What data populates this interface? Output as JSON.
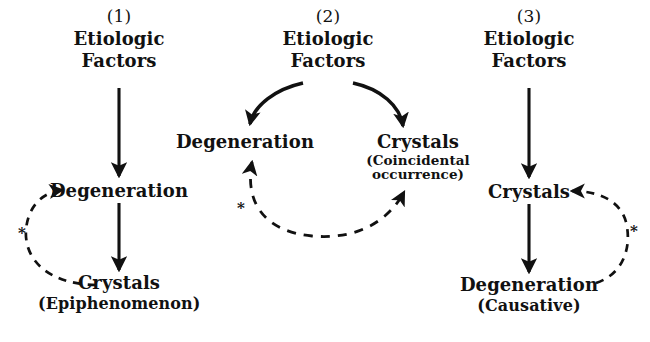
{
  "figure": {
    "background_color": "#ffffff",
    "ink_color": "#111111",
    "footnote_marker": "*"
  },
  "panels": [
    {
      "id": "panel-1",
      "number": "(1)",
      "nodes": {
        "top_line1": "Etiologic",
        "top_line2": "Factors",
        "middle": "Degeneration",
        "bottom": "Crystals",
        "bottom_qualifier": "(Epiphenomenon)"
      },
      "marker": "*"
    },
    {
      "id": "panel-2",
      "number": "(2)",
      "nodes": {
        "top_line1": "Etiologic",
        "top_line2": "Factors",
        "left": "Degeneration",
        "right": "Crystals",
        "right_qualifier_line1": "(Coincidental",
        "right_qualifier_line2": "occurrence)"
      },
      "marker": "*"
    },
    {
      "id": "panel-3",
      "number": "(3)",
      "nodes": {
        "top_line1": "Etiologic",
        "top_line2": "Factors",
        "middle": "Crystals",
        "bottom": "Degeneration",
        "bottom_qualifier": "(Causative)"
      },
      "marker": "*"
    }
  ]
}
